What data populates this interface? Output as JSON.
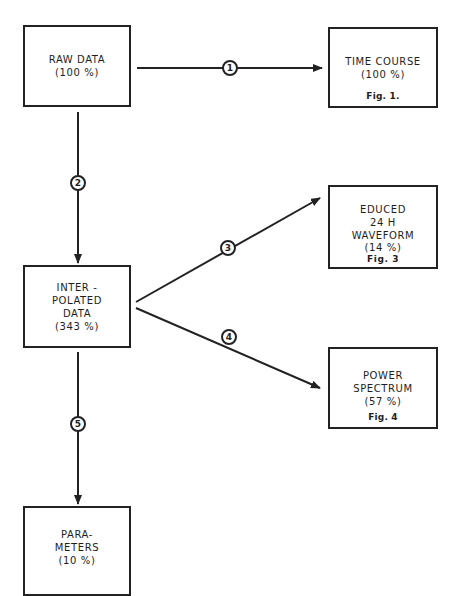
{
  "diagram": {
    "nodes": {
      "raw_data": {
        "lines": [
          "RAW DATA",
          "(100 %)"
        ]
      },
      "time_course": {
        "lines": [
          "TIME COURSE",
          "(100 %)"
        ],
        "figure": "Fig. 1."
      },
      "interpolated": {
        "lines": [
          "INTER -",
          "POLATED",
          "DATA",
          "(343 %)"
        ]
      },
      "educed": {
        "lines": [
          "EDUCED",
          "24 H",
          "WAVEFORM",
          "(14 %)"
        ],
        "figure": "Fig. 3"
      },
      "power_spectrum": {
        "lines": [
          "POWER",
          "SPECTRUM",
          "(57 %)"
        ],
        "figure": "Fig. 4"
      },
      "parameters": {
        "lines": [
          "PARA-",
          "METERS",
          "(10 %)"
        ]
      }
    },
    "edges": [
      {
        "label": "1",
        "from": "RAW DATA",
        "to": "TIME COURSE"
      },
      {
        "label": "2",
        "from": "RAW DATA",
        "to": "INTERPOLATED DATA"
      },
      {
        "label": "3",
        "from": "INTERPOLATED DATA",
        "to": "EDUCED 24 H WAVEFORM"
      },
      {
        "label": "4",
        "from": "INTERPOLATED DATA",
        "to": "POWER SPECTRUM"
      },
      {
        "label": "5",
        "from": "INTERPOLATED DATA",
        "to": "PARAMETERS"
      }
    ]
  }
}
